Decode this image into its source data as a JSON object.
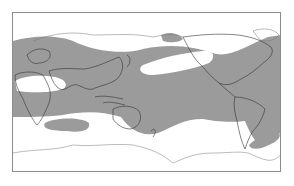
{
  "map": {
    "type": "world distribution map",
    "projection": "equirectangular, Pacific-centered",
    "colors": {
      "background": "#ffffff",
      "distribution_shade": "#9b9b9b",
      "coastline": "#333333",
      "frame": "#8c8c8c"
    },
    "legend": null,
    "labels": []
  }
}
